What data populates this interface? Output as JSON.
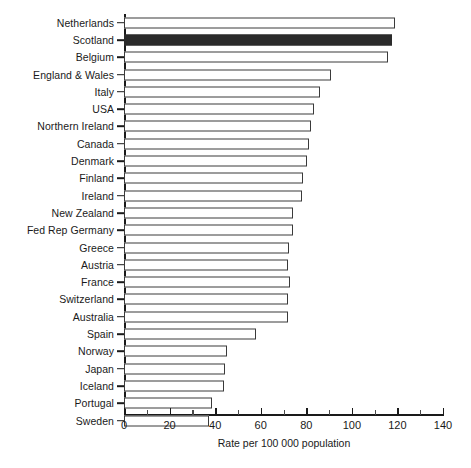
{
  "chart_data": {
    "type": "bar",
    "orientation": "horizontal",
    "title": "",
    "xlabel": "Rate per 100 000 population",
    "ylabel": "",
    "xlim": [
      0,
      140
    ],
    "xticks": [
      0,
      20,
      40,
      60,
      80,
      100,
      120,
      140
    ],
    "xtick_labels": [
      "0",
      "20",
      "40",
      "60",
      "80",
      "100",
      "120",
      "140"
    ],
    "minor_tick_interval": 10,
    "grid": false,
    "legend": null,
    "highlight_category": "Scotland",
    "colors": {
      "bar_fill": "#ffffff",
      "bar_edge": "#3a3a3a",
      "highlight_fill": "#2b2b2b",
      "axis": "#1a1a1a",
      "text": "#1a1a1a",
      "background": "#ffffff"
    },
    "categories": [
      "Netherlands",
      "Scotland",
      "Belgium",
      "England & Wales",
      "Italy",
      "USA",
      "Northern Ireland",
      "Canada",
      "Denmark",
      "Finland",
      "Ireland",
      "New Zealand",
      "Fed Rep Germany",
      "Greece",
      "Austria",
      "France",
      "Switzerland",
      "Australia",
      "Spain",
      "Norway",
      "Japan",
      "Iceland",
      "Portugal",
      "Sweden"
    ],
    "values": [
      119,
      117.5,
      116,
      91,
      86,
      83.5,
      82,
      81,
      80.5,
      78.5,
      78,
      74,
      74,
      72.5,
      72,
      73,
      72,
      72,
      58,
      45,
      44.5,
      44,
      38.5,
      37.5
    ]
  }
}
